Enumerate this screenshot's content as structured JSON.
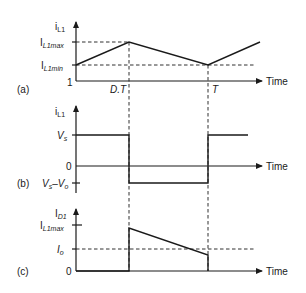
{
  "diagram": {
    "time_label": "Time",
    "markers": {
      "dt": "D.T",
      "t": "T"
    },
    "panel_a": {
      "tag": "(a)",
      "ylabel_main": "i",
      "ylabel_sub": "L1",
      "max_main": "I",
      "max_sub": "L1max",
      "min_main": "I",
      "min_sub": "L1min",
      "origin": "1"
    },
    "panel_b": {
      "tag": "(b)",
      "ylabel_main": "i",
      "ylabel_sub": "L1",
      "vs_main": "V",
      "vs_sub": "s",
      "zero": "0",
      "neg_label": "V",
      "neg_sub1": "s",
      "neg_dash": "–V",
      "neg_sub2": "o"
    },
    "panel_c": {
      "tag": "(c)",
      "ylabel_main": "I",
      "ylabel_sub": "D1",
      "max_main": "I",
      "max_sub": "L1max",
      "io_main": "I",
      "io_sub": "o",
      "zero": "0"
    }
  }
}
